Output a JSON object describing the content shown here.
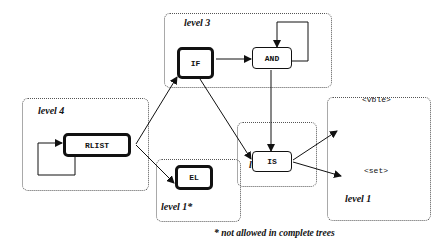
{
  "levels": {
    "level4": "level 4",
    "level3": "level 3",
    "level2": "level 2",
    "level1star": "level 1*",
    "level1": "level 1"
  },
  "nodes": {
    "rlist": "RLIST",
    "if": "IF",
    "and": "AND",
    "is": "IS",
    "el": "EL"
  },
  "terminals": {
    "vble": "<vble>",
    "set": "<set>"
  },
  "footnote": "* not allowed in complete trees",
  "edges": [
    {
      "from": "RLIST",
      "to": "RLIST",
      "type": "self-loop"
    },
    {
      "from": "RLIST",
      "to": "IF"
    },
    {
      "from": "RLIST",
      "to": "EL"
    },
    {
      "from": "IF",
      "to": "AND"
    },
    {
      "from": "IF",
      "to": "IS"
    },
    {
      "from": "AND",
      "to": "AND",
      "type": "self-loop"
    },
    {
      "from": "AND",
      "to": "IS"
    },
    {
      "from": "IS",
      "to": "<vble>"
    },
    {
      "from": "IS",
      "to": "<set>"
    }
  ]
}
